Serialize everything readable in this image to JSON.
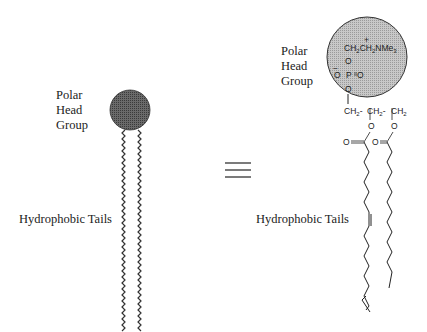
{
  "figure": {
    "left": {
      "head_label": [
        "Polar",
        "Head",
        "Group"
      ],
      "tail_label": "Hydrophobic Tails",
      "head_color": "#555555"
    },
    "equivalence_symbol": "≡",
    "right": {
      "head_label": [
        "Polar",
        "Head",
        "Group"
      ],
      "tail_label": "Hydrophobic Tails",
      "head_color": "#bbbbbb",
      "head_group_formula": {
        "choline": "CH₂CH₂NMe₃",
        "charge_plus": "+",
        "phosphate_left": "O",
        "phosphate_center": "P",
        "phosphate_right": "O",
        "charge_minus": "−",
        "bridge_o_top": "O",
        "bridge_o_bottom": "O"
      },
      "glycerol": [
        "CH₂-",
        "CH₂-",
        "CH₂"
      ],
      "ester_o": [
        "O",
        "O"
      ],
      "carbonyl_o": [
        "O=",
        "O="
      ]
    }
  }
}
